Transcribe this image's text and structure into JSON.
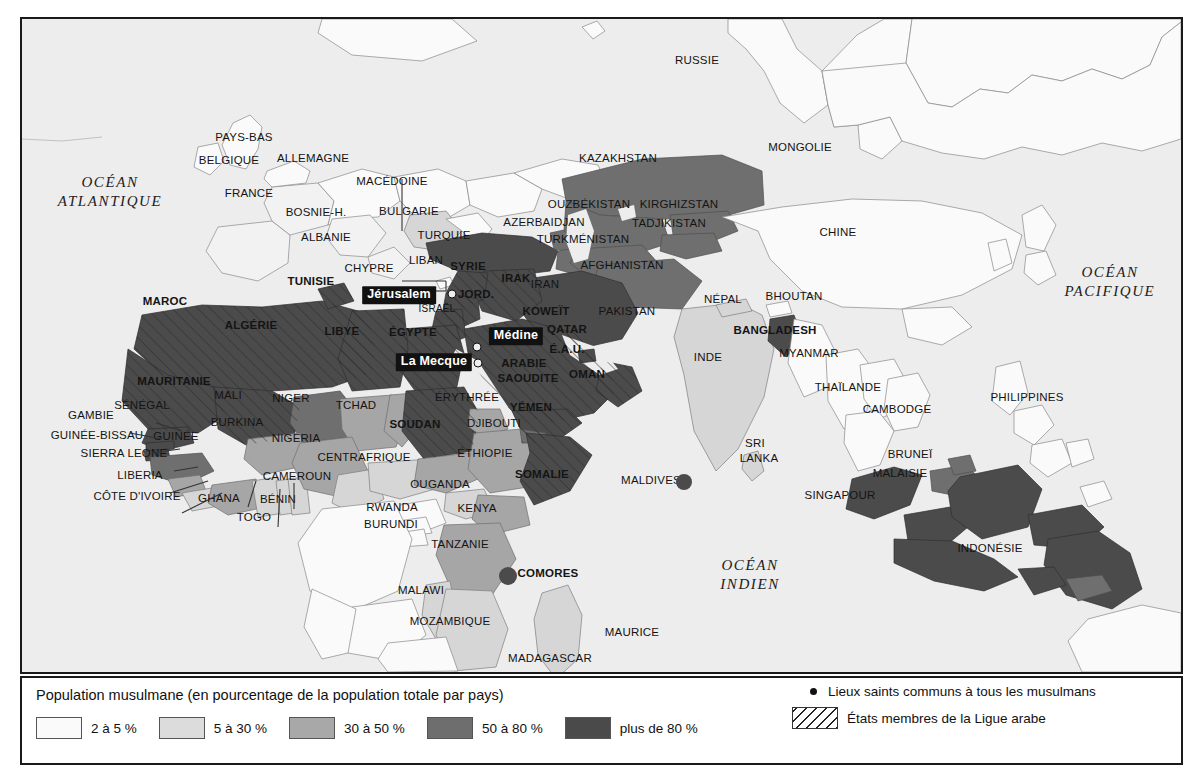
{
  "legend": {
    "title": "Population musulmane (en pourcentage de la population totale par pays)",
    "classes": [
      {
        "label": "2 à 5 %",
        "color": "#fafafa"
      },
      {
        "label": "5 à 30 %",
        "color": "#dcdcdc"
      },
      {
        "label": "30 à 50 %",
        "color": "#a8a8a8"
      },
      {
        "label": "50 à 80 %",
        "color": "#6e6e6e"
      },
      {
        "label": "plus de 80 %",
        "color": "#4a4a4a"
      }
    ],
    "holy_sites": "Lieux saints communs à tous les musulmans",
    "arab_league": "États membres  de la Ligue arabe"
  },
  "oceans": [
    {
      "id": "ocean-atlantique",
      "lines": [
        "OCÉAN",
        "ATLANTIQUE"
      ],
      "x": 110,
      "y": 190
    },
    {
      "id": "ocean-pacifique",
      "lines": [
        "OCÉAN",
        "PACIFIQUE"
      ],
      "x": 1110,
      "y": 280
    },
    {
      "id": "ocean-indien",
      "lines": [
        "OCÉAN",
        "INDIEN"
      ],
      "x": 750,
      "y": 573
    }
  ],
  "cities": [
    {
      "name": "Jérusalem",
      "x": 399,
      "y": 293,
      "dot_x": 452,
      "dot_y": 292
    },
    {
      "name": "Médine",
      "x": 516,
      "y": 334,
      "dot_x": 477,
      "dot_y": 345
    },
    {
      "name": "La Mecque",
      "x": 434,
      "y": 360,
      "dot_x": 478,
      "dot_y": 361
    }
  ],
  "countries": [
    {
      "name": "RUSSIE",
      "x": 697,
      "y": 59,
      "style": "country"
    },
    {
      "name": "PAYS-BAS",
      "x": 244,
      "y": 136,
      "style": "country"
    },
    {
      "name": "BELGIQUE",
      "x": 229,
      "y": 159,
      "style": "country"
    },
    {
      "name": "ALLEMAGNE",
      "x": 313,
      "y": 157,
      "style": "country"
    },
    {
      "name": "FRANCE",
      "x": 249,
      "y": 192,
      "style": "country"
    },
    {
      "name": "MACÉDOINE",
      "x": 392,
      "y": 180,
      "style": "country"
    },
    {
      "name": "BOSNIE-H.",
      "x": 316,
      "y": 211,
      "style": "country"
    },
    {
      "name": "BULGARIE",
      "x": 409,
      "y": 210,
      "style": "country"
    },
    {
      "name": "ALBANIE",
      "x": 326,
      "y": 236,
      "style": "country"
    },
    {
      "name": "TURQUIE",
      "x": 444,
      "y": 234,
      "style": "country"
    },
    {
      "name": "CHYPRE",
      "x": 369,
      "y": 267,
      "style": "country"
    },
    {
      "name": "LIBAN",
      "x": 426,
      "y": 259,
      "style": "country"
    },
    {
      "name": "SYRIE",
      "x": 468,
      "y": 265,
      "style": "country-bold"
    },
    {
      "name": "IRAK",
      "x": 516,
      "y": 277,
      "style": "country-bold"
    },
    {
      "name": "JORD.",
      "x": 476,
      "y": 293,
      "style": "country-bold"
    },
    {
      "name": "ISRAËL",
      "x": 437,
      "y": 307,
      "style": "small"
    },
    {
      "name": "KAZAKHSTAN",
      "x": 618,
      "y": 157,
      "style": "country"
    },
    {
      "name": "MONGOLIE",
      "x": 800,
      "y": 146,
      "style": "country"
    },
    {
      "name": "CHINE",
      "x": 838,
      "y": 231,
      "style": "country"
    },
    {
      "name": "OUZBÉKISTAN",
      "x": 589,
      "y": 203,
      "style": "country"
    },
    {
      "name": "KIRGHIZSTAN",
      "x": 679,
      "y": 203,
      "style": "country"
    },
    {
      "name": "AZERBAIDJAN",
      "x": 544,
      "y": 221,
      "style": "country"
    },
    {
      "name": "TADJIKISTAN",
      "x": 669,
      "y": 222,
      "style": "country"
    },
    {
      "name": "TURKMÉNISTAN",
      "x": 583,
      "y": 238,
      "style": "country"
    },
    {
      "name": "AFGHANISTAN",
      "x": 622,
      "y": 264,
      "style": "country"
    },
    {
      "name": "IRAN",
      "x": 545,
      "y": 283,
      "style": "country"
    },
    {
      "name": "PAKISTAN",
      "x": 627,
      "y": 310,
      "style": "country"
    },
    {
      "name": "KOWEÏT",
      "x": 546,
      "y": 310,
      "style": "country-bold"
    },
    {
      "name": "QATAR",
      "x": 567,
      "y": 328,
      "style": "country-bold"
    },
    {
      "name": "É.A.U.",
      "x": 567,
      "y": 348,
      "style": "country-bold"
    },
    {
      "name": "OMAN",
      "x": 587,
      "y": 373,
      "style": "country-bold"
    },
    {
      "name": "ARABIE",
      "x": 524,
      "y": 362,
      "style": "country-bold"
    },
    {
      "name": "SAOUDITE",
      "x": 528,
      "y": 377,
      "style": "country-bold"
    },
    {
      "name": "YÉMEN",
      "x": 531,
      "y": 406,
      "style": "country-bold"
    },
    {
      "name": "DJIBOUTI",
      "x": 494,
      "y": 422,
      "style": "country"
    },
    {
      "name": "NÉPAL",
      "x": 723,
      "y": 298,
      "style": "country"
    },
    {
      "name": "BHOUTAN",
      "x": 794,
      "y": 295,
      "style": "country"
    },
    {
      "name": "BANGLADESH",
      "x": 775,
      "y": 329,
      "style": "country-bold"
    },
    {
      "name": "MYANMAR",
      "x": 809,
      "y": 352,
      "style": "country"
    },
    {
      "name": "INDE",
      "x": 708,
      "y": 356,
      "style": "country"
    },
    {
      "name": "THAÏLANDE",
      "x": 848,
      "y": 386,
      "style": "country"
    },
    {
      "name": "CAMBODGE",
      "x": 897,
      "y": 408,
      "style": "country"
    },
    {
      "name": "PHILIPPINES",
      "x": 1027,
      "y": 396,
      "style": "country"
    },
    {
      "name": "SRI",
      "x": 755,
      "y": 442,
      "style": "country"
    },
    {
      "name": "LANKA",
      "x": 759,
      "y": 457,
      "style": "country"
    },
    {
      "name": "MALDIVES",
      "x": 651,
      "y": 479,
      "style": "country"
    },
    {
      "name": "BRUNEÏ",
      "x": 910,
      "y": 453,
      "style": "country"
    },
    {
      "name": "MALAISIE",
      "x": 900,
      "y": 472,
      "style": "country"
    },
    {
      "name": "SINGAPOUR",
      "x": 840,
      "y": 494,
      "style": "country"
    },
    {
      "name": "INDONÉSIE",
      "x": 990,
      "y": 547,
      "style": "country"
    },
    {
      "name": "MAROC",
      "x": 165,
      "y": 300,
      "style": "country-bold"
    },
    {
      "name": "TUNISIE",
      "x": 311,
      "y": 280,
      "style": "country-bold"
    },
    {
      "name": "ALGÉRIE",
      "x": 251,
      "y": 324,
      "style": "country-bold"
    },
    {
      "name": "LIBYE",
      "x": 342,
      "y": 330,
      "style": "country-bold"
    },
    {
      "name": "ÉGYPTE",
      "x": 413,
      "y": 331,
      "style": "country-bold"
    },
    {
      "name": "MAURITANIE",
      "x": 174,
      "y": 380,
      "style": "country-bold"
    },
    {
      "name": "MALI",
      "x": 228,
      "y": 394,
      "style": "country"
    },
    {
      "name": "NIGER",
      "x": 291,
      "y": 397,
      "style": "country"
    },
    {
      "name": "TCHAD",
      "x": 356,
      "y": 404,
      "style": "country"
    },
    {
      "name": "SÉNÉGAL",
      "x": 142,
      "y": 404,
      "style": "country"
    },
    {
      "name": "GAMBIE",
      "x": 91,
      "y": 414,
      "style": "country"
    },
    {
      "name": "GUINÉE-BISSAU",
      "x": 97,
      "y": 434,
      "style": "country"
    },
    {
      "name": "GUINÉE",
      "x": 176,
      "y": 435,
      "style": "country"
    },
    {
      "name": "SIERRA LEONE",
      "x": 124,
      "y": 452,
      "style": "country"
    },
    {
      "name": "LIBERIA",
      "x": 140,
      "y": 474,
      "style": "country"
    },
    {
      "name": "CÔTE D'IVOIRE",
      "x": 137,
      "y": 495,
      "style": "country"
    },
    {
      "name": "BURKINA",
      "x": 237,
      "y": 421,
      "style": "country"
    },
    {
      "name": "NIGERIA",
      "x": 296,
      "y": 437,
      "style": "country"
    },
    {
      "name": "GHANA",
      "x": 219,
      "y": 497,
      "style": "country"
    },
    {
      "name": "TOGO",
      "x": 254,
      "y": 516,
      "style": "country"
    },
    {
      "name": "BÉNIN",
      "x": 278,
      "y": 498,
      "style": "country"
    },
    {
      "name": "CAMEROUN",
      "x": 297,
      "y": 475,
      "style": "country"
    },
    {
      "name": "CENTRAFRIQUE",
      "x": 364,
      "y": 456,
      "style": "country"
    },
    {
      "name": "SOUDAN",
      "x": 415,
      "y": 423,
      "style": "country-bold"
    },
    {
      "name": "ÉRYTHRÉE",
      "x": 467,
      "y": 396,
      "style": "country"
    },
    {
      "name": "ÉTHIOPIE",
      "x": 485,
      "y": 452,
      "style": "country"
    },
    {
      "name": "SOMALIE",
      "x": 542,
      "y": 473,
      "style": "country-bold"
    },
    {
      "name": "OUGANDA",
      "x": 440,
      "y": 483,
      "style": "country"
    },
    {
      "name": "KENYA",
      "x": 477,
      "y": 507,
      "style": "country"
    },
    {
      "name": "RWANDA",
      "x": 392,
      "y": 506,
      "style": "country"
    },
    {
      "name": "BURUNDI",
      "x": 391,
      "y": 523,
      "style": "country"
    },
    {
      "name": "TANZANIE",
      "x": 460,
      "y": 543,
      "style": "country"
    },
    {
      "name": "MALAWI",
      "x": 421,
      "y": 589,
      "style": "country"
    },
    {
      "name": "MOZAMBIQUE",
      "x": 450,
      "y": 620,
      "style": "country"
    },
    {
      "name": "MADAGASCAR",
      "x": 550,
      "y": 657,
      "style": "country"
    },
    {
      "name": "MAURICE",
      "x": 632,
      "y": 631,
      "style": "country"
    },
    {
      "name": "COMORES",
      "x": 548,
      "y": 572,
      "style": "country-bold"
    }
  ],
  "holy_dots": [
    {
      "x": 452,
      "y": 292
    },
    {
      "x": 477,
      "y": 345
    },
    {
      "x": 478,
      "y": 361
    }
  ],
  "marker_dots": [
    {
      "x": 684,
      "y": 480,
      "r": 8
    },
    {
      "x": 508,
      "y": 574,
      "r": 9
    }
  ]
}
